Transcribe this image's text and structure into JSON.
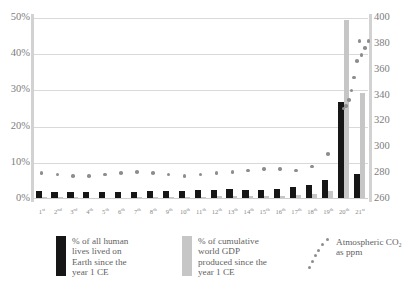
{
  "chart_data": {
    "type": "bar",
    "title": "",
    "subtitle": "",
    "xlabel": "",
    "ylabel": "",
    "y2label": "",
    "grid": true,
    "legend_position": "bottom",
    "categories": [
      "1st",
      "2nd",
      "3rd",
      "4th",
      "5th",
      "6th",
      "7th",
      "8th",
      "9th",
      "10th",
      "11th",
      "12th",
      "13th",
      "14th",
      "15th",
      "16th",
      "17th",
      "18th",
      "19th",
      "20th",
      "21st"
    ],
    "category_suffixes": [
      "st",
      "nd",
      "rd",
      "th",
      "th",
      "th",
      "th",
      "th",
      "th",
      "th",
      "th",
      "th",
      "th",
      "th",
      "th",
      "th",
      "th",
      "th",
      "th",
      "th",
      "st"
    ],
    "ylim": [
      0,
      50
    ],
    "yticks": [
      "0%",
      "10%",
      "20%",
      "30%",
      "40%",
      "50%"
    ],
    "ytick_values": [
      0,
      10,
      20,
      30,
      40,
      50
    ],
    "y2lim": [
      260,
      400
    ],
    "y2ticks": [
      "260",
      "280",
      "300",
      "320",
      "340",
      "360",
      "380",
      "400"
    ],
    "y2tick_values": [
      260,
      280,
      300,
      320,
      340,
      360,
      380,
      400
    ],
    "series": [
      {
        "name": "% of all human lives lived on Earth since the year 1 CE",
        "type": "bar",
        "color": "#161616",
        "axis": "left",
        "values": [
          2.2,
          2.0,
          1.9,
          1.9,
          1.9,
          1.9,
          2.0,
          2.1,
          2.1,
          2.2,
          2.4,
          2.6,
          2.7,
          2.5,
          2.5,
          2.9,
          3.2,
          3.8,
          5.2,
          26.8,
          6.9
        ]
      },
      {
        "name": "% of cumulative world GDP produced since the year 1 CE",
        "type": "bar",
        "color": "#c6c6c6",
        "axis": "left",
        "values": [
          0.55,
          0.5,
          0.45,
          0.4,
          0.4,
          0.4,
          0.45,
          0.5,
          0.5,
          0.55,
          0.6,
          0.7,
          0.75,
          0.7,
          0.75,
          0.9,
          1.0,
          1.3,
          2.3,
          49.5,
          29.2
        ]
      },
      {
        "name": "Atmospheric CO2 as ppm",
        "type": "scatter",
        "color": "#8d8d8d",
        "axis": "right",
        "values": [
          280,
          279,
          278,
          278,
          279,
          280,
          281,
          280,
          279,
          278,
          279,
          280,
          281,
          282,
          283,
          283,
          282,
          285,
          295,
          330,
          382
        ]
      }
    ]
  },
  "axes": {
    "left": {
      "ticks": [
        "50%",
        "40%",
        "30%",
        "20%",
        "10%",
        "0%"
      ]
    },
    "right": {
      "ticks": [
        "400",
        "380",
        "360",
        "340",
        "320",
        "300",
        "280",
        "260"
      ]
    }
  },
  "legend": {
    "items": [
      {
        "swatch": "black",
        "label": "% of all human\nlives lived on\nEarth since the\nyear 1 CE"
      },
      {
        "swatch": "gray",
        "label": "% of cumulative\nworld GDP\nproduced since the\nyear 1 CE"
      },
      {
        "swatch": "dots",
        "label": "Atmospheric CO₂\nas ppm"
      }
    ]
  }
}
